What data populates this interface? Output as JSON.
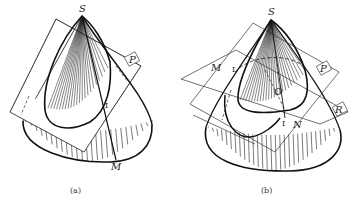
{
  "figure": {
    "colors": {
      "ink": "#1a1a1a",
      "paper": "#ffffff"
    },
    "panels": [
      {
        "id": "a",
        "caption": "(a)",
        "labels": {
          "apex": "S",
          "plane": "P",
          "point_one": "I",
          "point_m": "M"
        }
      },
      {
        "id": "b",
        "caption": "(b)",
        "labels": {
          "apex": "S",
          "plane_p": "P",
          "plane_r": "R",
          "point_m": "M",
          "point_one_top": "I",
          "point_one_bottom": "I",
          "center": "O",
          "point_n": "N"
        }
      }
    ]
  }
}
